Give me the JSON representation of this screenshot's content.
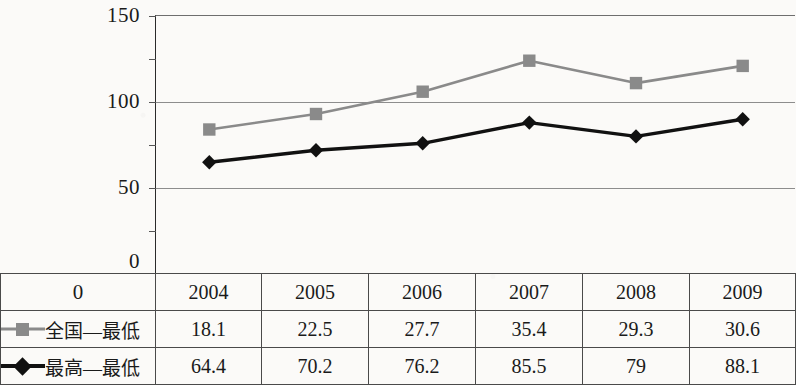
{
  "chart_data": {
    "type": "line",
    "title": "",
    "xlabel": "",
    "ylabel": "",
    "categories": [
      "2004",
      "2005",
      "2006",
      "2007",
      "2008",
      "2009"
    ],
    "ylim": [
      0,
      150
    ],
    "yticks": [
      0,
      50,
      100,
      150
    ],
    "grid": true,
    "legend_position": "table-row-headers",
    "series": [
      {
        "name": "全国—最低",
        "marker": "square",
        "color": "#8a8a8a",
        "plotted_values": [
          84,
          93,
          106,
          124,
          111,
          121
        ],
        "table_values": [
          "18.1",
          "22.5",
          "27.7",
          "35.4",
          "29.3",
          "30.6"
        ]
      },
      {
        "name": "最高—最低",
        "marker": "diamond",
        "color": "#111111",
        "plotted_values": [
          65,
          72,
          76,
          88,
          80,
          90
        ],
        "table_values": [
          "64.4",
          "70.2",
          "76.2",
          "85.5",
          "79",
          "88.1"
        ]
      }
    ]
  },
  "axis": {
    "y_tick_labels": [
      "150",
      "100",
      "50",
      "0"
    ]
  },
  "table": {
    "header_row": [
      "2004",
      "2005",
      "2006",
      "2007",
      "2008",
      "2009"
    ],
    "rows": [
      {
        "label": "全国—最低",
        "marker": "square",
        "values": [
          "18.1",
          "22.5",
          "27.7",
          "35.4",
          "29.3",
          "30.6"
        ]
      },
      {
        "label": "最高—最低",
        "marker": "diamond",
        "values": [
          "64.4",
          "70.2",
          "76.2",
          "85.5",
          "79",
          "88.1"
        ]
      }
    ]
  },
  "colors": {
    "series_gray": "#8a8a8a",
    "series_black": "#111111",
    "gridline": "#8d8d8d",
    "border": "#4a4a4a",
    "paper": "#fbfaf8"
  }
}
